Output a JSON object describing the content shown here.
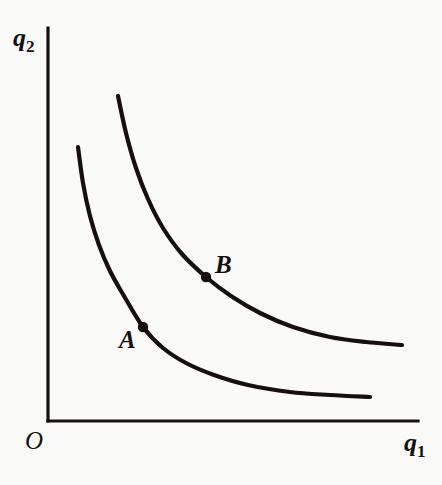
{
  "figure": {
    "background_color": "#fafaf9",
    "ink_color": "#15100e",
    "width": 442,
    "height": 485
  },
  "axes": {
    "x_label_base": "q",
    "x_label_sub": "1",
    "y_label_base": "q",
    "y_label_sub": "2",
    "origin_label": "O",
    "x_axis_start": [
      48,
      421
    ],
    "x_axis_end": [
      418,
      421
    ],
    "y_axis_start": [
      48,
      421
    ],
    "y_axis_end": [
      48,
      28
    ],
    "line_width": 3
  },
  "points": [
    {
      "id": "A",
      "label": "A",
      "cx": 143,
      "cy": 327,
      "r": 5.2,
      "label_x": 119,
      "label_y": 327
    },
    {
      "id": "B",
      "label": "B",
      "cx": 206,
      "cy": 277,
      "r": 5.2,
      "label_x": 215,
      "label_y": 252
    }
  ],
  "chart_data": {
    "type": "line",
    "xlabel": "q1",
    "ylabel": "q2",
    "grid": false,
    "legend": null,
    "annotations": [
      {
        "text": "A",
        "x": 143,
        "y": 327,
        "series": "lower-indifference-curve"
      },
      {
        "text": "B",
        "x": 206,
        "y": 277,
        "series": "upper-indifference-curve"
      },
      {
        "text": "O",
        "x": 48,
        "y": 421,
        "series": "origin"
      }
    ],
    "axis_pixel_ranges": {
      "x": [
        48,
        418
      ],
      "y": [
        421,
        28
      ]
    },
    "series": [
      {
        "name": "lower-indifference-curve",
        "stroke": "#15100e",
        "stroke_width": 4.2,
        "path_points": [
          [
            78,
            147
          ],
          [
            83,
            183
          ],
          [
            90,
            216
          ],
          [
            99,
            245
          ],
          [
            110,
            271
          ],
          [
            124,
            296
          ],
          [
            143,
            327
          ],
          [
            163,
            348
          ],
          [
            186,
            363
          ],
          [
            214,
            375
          ],
          [
            248,
            385
          ],
          [
            290,
            392
          ],
          [
            330,
            395
          ],
          [
            370,
            397
          ]
        ]
      },
      {
        "name": "upper-indifference-curve",
        "stroke": "#15100e",
        "stroke_width": 4.2,
        "path_points": [
          [
            118,
            96
          ],
          [
            126,
            133
          ],
          [
            136,
            168
          ],
          [
            148,
            199
          ],
          [
            163,
            228
          ],
          [
            182,
            254
          ],
          [
            206,
            277
          ],
          [
            231,
            296
          ],
          [
            260,
            313
          ],
          [
            293,
            327
          ],
          [
            330,
            337
          ],
          [
            366,
            342
          ],
          [
            402,
            345
          ]
        ]
      }
    ]
  }
}
